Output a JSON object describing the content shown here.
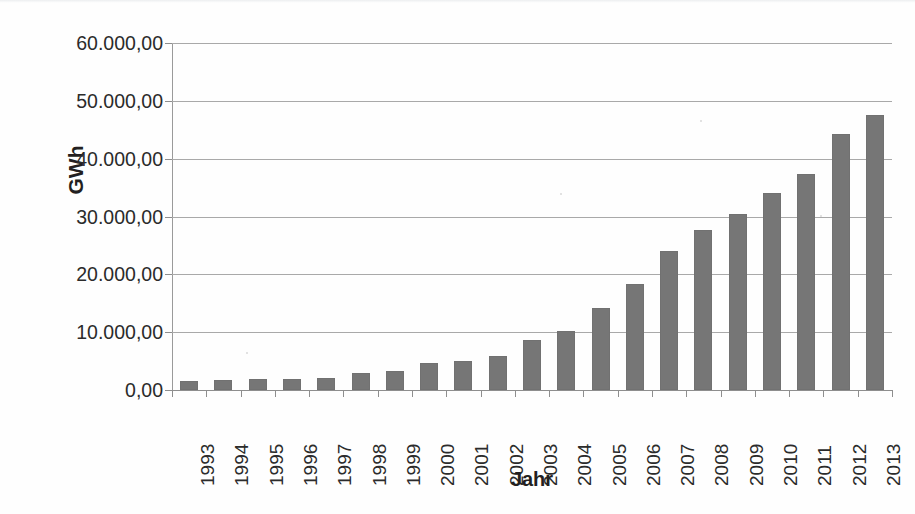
{
  "chart_data": {
    "type": "bar",
    "title": "",
    "xlabel": "Jahr",
    "ylabel": "GWh",
    "categories": [
      "1993",
      "1994",
      "1995",
      "1996",
      "1997",
      "1998",
      "1999",
      "2000",
      "2001",
      "2002",
      "2003",
      "2004",
      "2005",
      "2006",
      "2007",
      "2008",
      "2009",
      "2010",
      "2011",
      "2012",
      "2013"
    ],
    "values": [
      1550,
      1750,
      1850,
      1900,
      2100,
      2900,
      3300,
      4600,
      5100,
      5900,
      8600,
      10200,
      14100,
      18400,
      24100,
      27600,
      30400,
      34100,
      37400,
      44300,
      47600
    ],
    "ylim": [
      0,
      60000
    ],
    "ytick_values": [
      0,
      10000,
      20000,
      30000,
      40000,
      50000,
      60000
    ],
    "ytick_labels": [
      "0,00",
      "10.000,00",
      "20.000,00",
      "30.000,00",
      "40.000,00",
      "50.000,00",
      "60.000,00"
    ],
    "grid": true,
    "grid_axis": "y",
    "legend": "none",
    "bar_color": "#767676",
    "gridline_color": "#a9a9a9",
    "axis_color": "#8e8e8e",
    "text_color": "#231f20",
    "xtick_rotation": 90,
    "number_format": "de-DE",
    "series": [
      {
        "name": "GWh",
        "values": [
          1550,
          1750,
          1850,
          1900,
          2100,
          2900,
          3300,
          4600,
          5100,
          5900,
          8600,
          10200,
          14100,
          18400,
          24100,
          27600,
          30400,
          34100,
          37400,
          44300,
          47600
        ]
      }
    ]
  }
}
